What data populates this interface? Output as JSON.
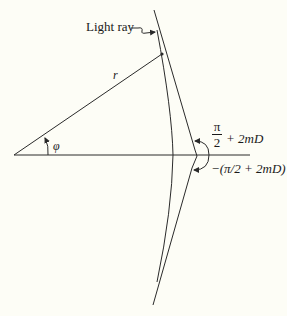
{
  "diagram": {
    "type": "light-ray-deflection",
    "labels": {
      "light_ray": "Light ray",
      "radius": "r",
      "angle": "φ",
      "upper_angle_num": "π",
      "upper_angle_den": "2",
      "upper_angle_rest": "+ 2mD",
      "lower_angle": "−(π/2 + 2mD)"
    },
    "colors": {
      "line": "#2a2a2a",
      "background": "#fdfdf6"
    }
  }
}
